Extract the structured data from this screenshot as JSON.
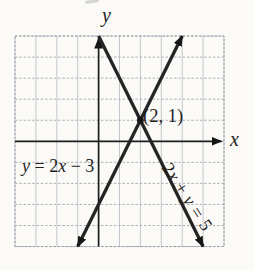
{
  "figure": {
    "axis_labels": {
      "x": "x",
      "y": "y"
    },
    "intersection_label": "(2, 1)",
    "eq1": {
      "p0": "y",
      "p1": " = 2",
      "p2": "x",
      "p3": " − 3",
      "full": "y = 2x − 3"
    },
    "eq2": {
      "p0": "2",
      "p1": "x",
      "p2": " + ",
      "p3": "y",
      "p4": " = 5",
      "full": "2x + y = 5"
    }
  },
  "chart_data": {
    "type": "line",
    "title": "",
    "xlabel": "x",
    "ylabel": "y",
    "x_range": [
      -4,
      6
    ],
    "y_range": [
      -5,
      5
    ],
    "grid": true,
    "grid_step": 1,
    "series": [
      {
        "name": "y = 2x − 3",
        "slope": 2,
        "y_intercept": -3,
        "points": [
          [
            -1,
            -5
          ],
          [
            4,
            5
          ]
        ],
        "arrows": "both"
      },
      {
        "name": "2x + y = 5",
        "slope": -2,
        "y_intercept": 5,
        "points": [
          [
            0,
            5
          ],
          [
            5,
            -5
          ]
        ],
        "arrows": "end"
      }
    ],
    "intersection": {
      "x": 2,
      "y": 1,
      "label": "(2, 1)"
    }
  },
  "colors": {
    "line": "#242424",
    "grid_vertical": "#c3c7cd",
    "grid_horizontal": "#acb1b9",
    "background": "#fbfaf7",
    "text": "#1e1e1e"
  }
}
